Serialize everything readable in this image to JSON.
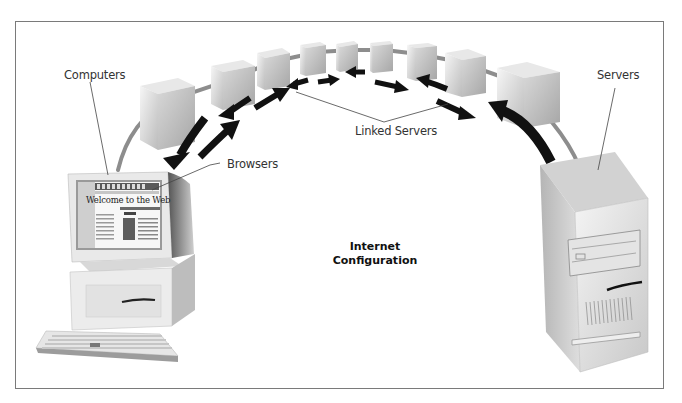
{
  "diagram": {
    "title_line1": "Internet",
    "title_line2": "Configuration",
    "labels": {
      "computers": "Computers",
      "browsers": "Browsers",
      "linked_servers": "Linked Servers",
      "servers": "Servers"
    },
    "browser_screen": {
      "headline": "Welcome to the Web"
    },
    "nodes": {
      "client": "computer-with-browser",
      "server": "tower-server",
      "linked_server_count": 9
    },
    "colors": {
      "frame": "#7a7a7a",
      "arrow": "#111111",
      "cable": "#8a8a8a",
      "cube_light": "#f2f2f2",
      "cube_dark": "#bdbdbd"
    }
  }
}
